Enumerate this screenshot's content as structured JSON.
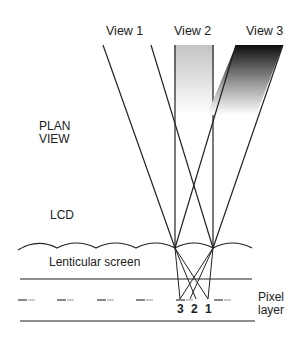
{
  "diagram": {
    "views": [
      {
        "label": "View 1"
      },
      {
        "label": "View 2"
      },
      {
        "label": "View 3"
      }
    ],
    "labels": {
      "plan_view_line1": "PLAN",
      "plan_view_line2": "VIEW",
      "lcd": "LCD",
      "lenticular_screen": "Lenticular screen",
      "pixel_line1": "Pixel",
      "pixel_line2": "layer"
    },
    "pixel_numbers": [
      "3",
      "2",
      "1"
    ],
    "colors": {
      "line": "#222222",
      "view2_fill_top": "#c8c8c8",
      "view3_fill_top": "#111111",
      "pixel_dark": "#888888",
      "pixel_light": "#cccccc"
    }
  }
}
